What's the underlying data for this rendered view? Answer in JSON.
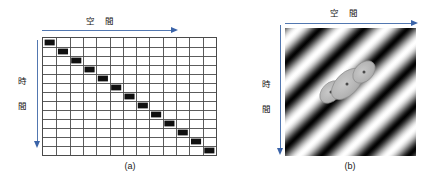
{
  "figure": {
    "panels": [
      {
        "id": "a",
        "caption": "(a)",
        "x_axis_label": "空　間",
        "y_axis_label_chars": [
          "時",
          "間"
        ],
        "type": "grid-diagonal",
        "columns": 13,
        "rows": 13,
        "marker_color": "#101010",
        "grid_line_color": "#4a4a4a"
      },
      {
        "id": "b",
        "caption": "(b)",
        "x_axis_label": "空　間",
        "y_axis_label_chars": [
          "時",
          "間"
        ],
        "type": "sinusoidal-grating",
        "grating_orientation_deg": 45,
        "grating_cycles": 6,
        "ellipse_count": 3,
        "ellipse_color": "#b0b0b0"
      }
    ],
    "arrow_color": "#5277b0",
    "arrow_head_color": "#3a63a8"
  },
  "chart_data": {
    "type": "heatmap",
    "title": "",
    "xlabel": "空　間",
    "ylabel": "時　間",
    "panels": [
      {
        "name": "(a)",
        "type": "heatmap",
        "grid": {
          "columns": 13,
          "rows": 13
        },
        "filled_cells": [
          [
            0,
            0
          ],
          [
            1,
            1
          ],
          [
            2,
            2
          ],
          [
            3,
            3
          ],
          [
            4,
            4
          ],
          [
            5,
            5
          ],
          [
            6,
            6
          ],
          [
            7,
            7
          ],
          [
            8,
            8
          ],
          [
            9,
            9
          ],
          [
            10,
            10
          ],
          [
            11,
            11
          ],
          [
            12,
            12
          ]
        ],
        "description": "Black squares along the main diagonal; a point moving uniformly in space over time."
      },
      {
        "name": "(b)",
        "type": "heatmap",
        "description": "Diagonal sinusoidal luminance grating, about 6 cycles, oriented 45 degrees, with three overlapping grey ellipses (receptive fields) near the centre.",
        "ellipses": [
          {
            "cx": 46,
            "cy": 64,
            "rx": 13,
            "ry": 9,
            "rotation_deg": 45
          },
          {
            "cx": 62,
            "cy": 56,
            "rx": 19,
            "ry": 11,
            "rotation_deg": 45
          },
          {
            "cx": 79,
            "cy": 44,
            "rx": 13,
            "ry": 9,
            "rotation_deg": 45
          }
        ]
      }
    ]
  }
}
